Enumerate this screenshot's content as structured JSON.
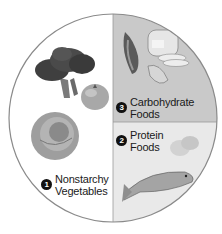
{
  "diagram": {
    "type": "plate-method",
    "colors": {
      "plate_outline": "#8a8a8a",
      "vegetables_section": "#ffffff",
      "carbohydrate_section": "#c9c9c9",
      "protein_section": "#e9e9e9",
      "badge": "#111111",
      "label_text": "#1a1a1a"
    },
    "sections": [
      {
        "number": "1",
        "line1": "Nonstarchy",
        "line2": "Vegetables",
        "portion": "half plate (left)",
        "illustrations": [
          "broccoli",
          "tomato",
          "cabbage"
        ]
      },
      {
        "number": "2",
        "line1": "Protein",
        "line2": "Foods",
        "portion": "quarter plate (bottom right)",
        "illustrations": [
          "eggs",
          "fish"
        ]
      },
      {
        "number": "3",
        "line1": "Carbohydrate",
        "line2": "Foods",
        "portion": "quarter plate (top right)",
        "illustrations": [
          "corn",
          "bread-loaf",
          "peanut-shell"
        ]
      }
    ]
  }
}
